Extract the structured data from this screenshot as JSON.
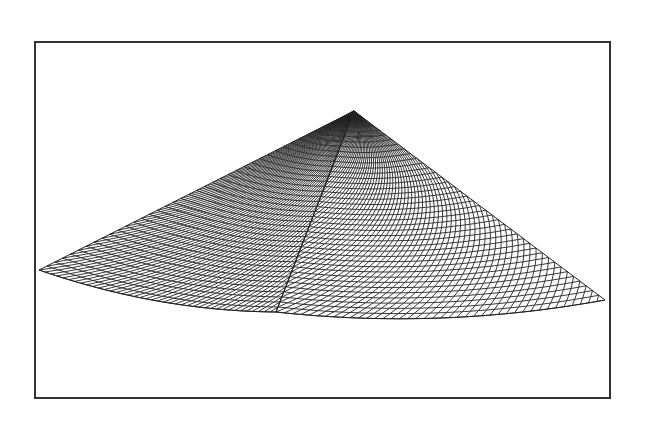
{
  "chart_data": {
    "type": "surface",
    "title": "",
    "xlabel": "",
    "ylabel": "",
    "zlabel": "",
    "axes_visible": false,
    "grid": false,
    "legend": null,
    "mesh_resolution": 40,
    "projected_vertices_px": {
      "apex": [
        354,
        111
      ],
      "left": [
        39,
        270
      ],
      "front": [
        276,
        312
      ],
      "right": [
        605,
        300
      ]
    },
    "bottom_edge_sag_px": {
      "left_edge": 10,
      "right_edge": 12
    },
    "line_color": "#222222",
    "fill_color": "#ffffff"
  },
  "frame": {
    "x": 34,
    "y": 41,
    "width": 577,
    "height": 358,
    "border_color": "#333333"
  }
}
